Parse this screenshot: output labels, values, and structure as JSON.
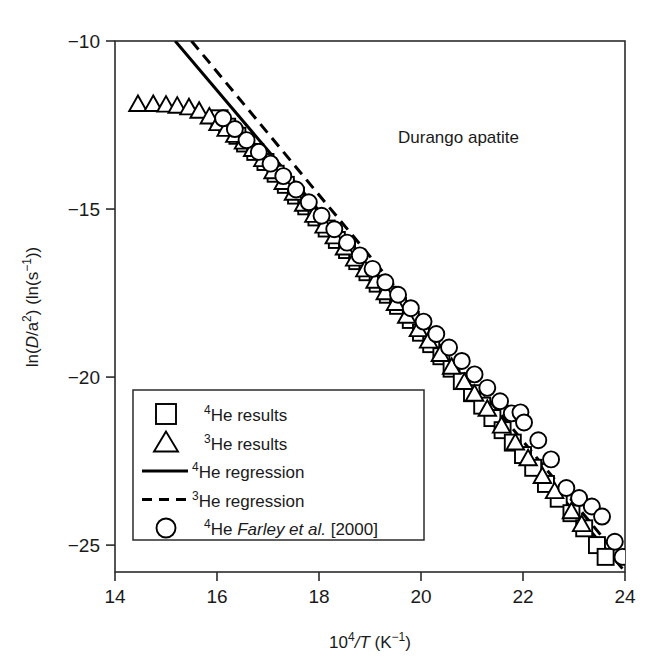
{
  "figure": {
    "annotation": "Durango apatite",
    "background_color": "#ffffff",
    "line_color": "#000000"
  },
  "chart_data": {
    "type": "scatter",
    "title": "",
    "annotation": "Durango apatite",
    "xlabel_plain": "10^4/T (K^-1)",
    "xlabel_parts": {
      "base": "10",
      "exp": "4",
      "slash_var": "/T",
      "unit_open": " (K",
      "unit_exp": "−1",
      "unit_close": ")"
    },
    "ylabel_plain": "ln(D/a^2) (ln(s^-1))",
    "ylabel_parts": {
      "open": "ln(",
      "var": "D",
      "slash": "/a",
      "var_exp": "2",
      "mid": ") (ln(s",
      "unit_exp": "−1",
      "close": "))"
    },
    "xlim": [
      14,
      24
    ],
    "ylim": [
      -25.8,
      -10.0
    ],
    "xticks": [
      14,
      16,
      18,
      20,
      22,
      24
    ],
    "xtick_labels": [
      "14",
      "16",
      "18",
      "20",
      "22",
      "24"
    ],
    "yticks": [
      -10,
      -15,
      -20,
      -25
    ],
    "ytick_labels": [
      "−10",
      "−15",
      "−20",
      "−25"
    ],
    "grid": false,
    "legend_position": "lower-left-inside",
    "series": [
      {
        "name": "4He results",
        "marker": "square",
        "label_parts": {
          "sup": "4",
          "text": "He results"
        },
        "points": [
          [
            16.05,
            -12.3
          ],
          [
            16.2,
            -12.55
          ],
          [
            16.4,
            -12.82
          ],
          [
            16.55,
            -13.05
          ],
          [
            16.75,
            -13.3
          ],
          [
            16.95,
            -13.6
          ],
          [
            17.15,
            -13.95
          ],
          [
            17.35,
            -14.28
          ],
          [
            17.55,
            -14.6
          ],
          [
            17.75,
            -14.92
          ],
          [
            17.95,
            -15.25
          ],
          [
            18.15,
            -15.58
          ],
          [
            18.35,
            -15.92
          ],
          [
            18.55,
            -16.22
          ],
          [
            18.75,
            -16.55
          ],
          [
            18.95,
            -16.88
          ],
          [
            19.15,
            -17.22
          ],
          [
            19.35,
            -17.55
          ],
          [
            19.55,
            -17.88
          ],
          [
            19.8,
            -18.3
          ],
          [
            20.0,
            -18.68
          ],
          [
            20.2,
            -19.02
          ],
          [
            20.4,
            -19.38
          ],
          [
            20.6,
            -19.75
          ],
          [
            20.8,
            -20.12
          ],
          [
            21.0,
            -20.48
          ],
          [
            21.2,
            -20.85
          ],
          [
            21.4,
            -21.22
          ],
          [
            21.6,
            -21.58
          ],
          [
            21.8,
            -21.95
          ],
          [
            22.0,
            -22.32
          ],
          [
            22.2,
            -22.7
          ],
          [
            22.45,
            -23.18
          ],
          [
            22.7,
            -23.62
          ],
          [
            22.95,
            -24.05
          ],
          [
            23.2,
            -24.5
          ],
          [
            23.45,
            -25.0
          ],
          [
            23.62,
            -25.35
          ]
        ]
      },
      {
        "name": "3He results",
        "marker": "triangle",
        "label_parts": {
          "sup": "3",
          "text": "He results"
        },
        "points": [
          [
            14.45,
            -11.88
          ],
          [
            14.75,
            -11.88
          ],
          [
            15.0,
            -11.9
          ],
          [
            15.22,
            -11.93
          ],
          [
            15.45,
            -11.98
          ],
          [
            15.65,
            -12.08
          ],
          [
            15.85,
            -12.25
          ],
          [
            16.02,
            -12.45
          ],
          [
            16.18,
            -12.62
          ],
          [
            16.35,
            -12.8
          ],
          [
            16.52,
            -13.0
          ],
          [
            16.7,
            -13.22
          ],
          [
            16.9,
            -13.52
          ],
          [
            17.1,
            -13.88
          ],
          [
            17.3,
            -14.2
          ],
          [
            17.5,
            -14.52
          ],
          [
            17.7,
            -14.85
          ],
          [
            17.9,
            -15.18
          ],
          [
            18.1,
            -15.5
          ],
          [
            18.3,
            -15.82
          ],
          [
            18.5,
            -16.15
          ],
          [
            18.7,
            -16.48
          ],
          [
            18.9,
            -16.8
          ],
          [
            19.1,
            -17.14
          ],
          [
            19.3,
            -17.48
          ],
          [
            19.5,
            -17.8
          ],
          [
            19.72,
            -18.18
          ],
          [
            19.95,
            -18.58
          ],
          [
            20.15,
            -18.92
          ],
          [
            20.38,
            -19.32
          ],
          [
            20.6,
            -19.7
          ],
          [
            20.85,
            -20.15
          ],
          [
            21.05,
            -20.5
          ],
          [
            21.3,
            -20.95
          ],
          [
            21.58,
            -21.45
          ],
          [
            21.85,
            -21.95
          ],
          [
            22.1,
            -22.42
          ],
          [
            22.38,
            -22.95
          ],
          [
            22.62,
            -23.4
          ],
          [
            22.95,
            -24.0
          ],
          [
            23.15,
            -24.38
          ]
        ]
      },
      {
        "name": "4He Farley et al. [2000]",
        "marker": "circle",
        "label_parts": {
          "sup": "4",
          "text_pre": "He ",
          "italic": "Farley et al.",
          "text_post": " [2000]"
        },
        "points": [
          [
            16.12,
            -12.3
          ],
          [
            16.35,
            -12.62
          ],
          [
            16.58,
            -12.95
          ],
          [
            16.82,
            -13.3
          ],
          [
            17.05,
            -13.65
          ],
          [
            17.3,
            -14.02
          ],
          [
            17.55,
            -14.42
          ],
          [
            17.8,
            -14.8
          ],
          [
            18.05,
            -15.2
          ],
          [
            18.3,
            -15.6
          ],
          [
            18.55,
            -16.0
          ],
          [
            18.8,
            -16.38
          ],
          [
            19.05,
            -16.78
          ],
          [
            19.3,
            -17.18
          ],
          [
            19.55,
            -17.55
          ],
          [
            19.8,
            -17.95
          ],
          [
            20.05,
            -18.35
          ],
          [
            20.3,
            -18.72
          ],
          [
            20.55,
            -19.12
          ],
          [
            20.8,
            -19.52
          ],
          [
            21.05,
            -19.92
          ],
          [
            21.3,
            -20.32
          ],
          [
            21.55,
            -20.72
          ],
          [
            21.78,
            -21.08
          ],
          [
            21.95,
            -21.05
          ],
          [
            22.02,
            -21.35
          ],
          [
            22.3,
            -21.88
          ],
          [
            22.55,
            -22.45
          ],
          [
            22.85,
            -23.3
          ],
          [
            23.1,
            -23.6
          ],
          [
            23.35,
            -23.85
          ],
          [
            23.55,
            -24.15
          ],
          [
            23.8,
            -24.9
          ],
          [
            23.95,
            -25.35
          ]
        ]
      }
    ],
    "fits": [
      {
        "name": "4He regression",
        "style": "solid",
        "label_parts": {
          "sup": "4",
          "text": "He regression"
        },
        "x_start": 15.18,
        "y_start": -10.0,
        "x_end": 23.95,
        "y_end": -25.7
      },
      {
        "name": "3He regression",
        "style": "dashed",
        "label_parts": {
          "sup": "3",
          "text": "He regression"
        },
        "x_start": 15.5,
        "y_start": -10.0,
        "x_end": 23.88,
        "y_end": -25.35
      }
    ]
  },
  "legend": {
    "items": [
      {
        "marker": "square",
        "sup": "4",
        "text": "He results"
      },
      {
        "marker": "triangle",
        "sup": "3",
        "text": "He results"
      },
      {
        "marker": "line",
        "sup": "4",
        "text": "He regression"
      },
      {
        "marker": "dashed",
        "sup": "3",
        "text": "He regression"
      },
      {
        "marker": "circle",
        "sup": "4",
        "text": "He Farley et al. [2000]"
      }
    ]
  }
}
